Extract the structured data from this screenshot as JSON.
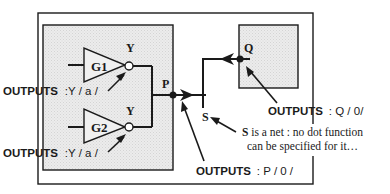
{
  "diagram": {
    "colors": {
      "line": "#1a1a1a",
      "shade": "#e6e6e6",
      "background": "#ffffff"
    },
    "gates": [
      {
        "name": "G1",
        "output_pin": "Y",
        "annotation_key": "OUTPUTS",
        "annotation_value": ":Y / a /"
      },
      {
        "name": "G2",
        "output_pin": "Y",
        "annotation_key": "OUTPUTS",
        "annotation_value": ":Y / a /"
      }
    ],
    "block_pin": {
      "name": "P",
      "annotation_key": "OUTPUTS",
      "annotation_value": ": P / 0 /"
    },
    "right_block_pin": {
      "name": "Q",
      "annotation_key": "OUTPUTS",
      "annotation_value": ": Q / 0/"
    },
    "net": {
      "name": "S",
      "note_bold": "S",
      "note_line1": " is a net : no dot function",
      "note_line2": "can be specified for it…"
    }
  }
}
